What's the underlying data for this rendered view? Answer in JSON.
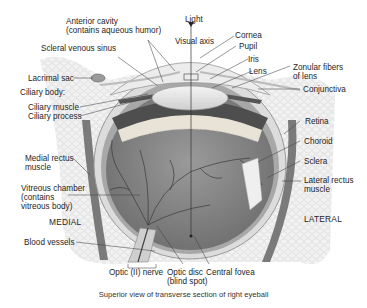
{
  "diagram": {
    "title": "Superior view of transverse section of right eyeball",
    "colors": {
      "background": "#ffffff",
      "tissue_light": "#e6e6e6",
      "tissue_mid": "#bdbdbd",
      "vitreous": "#8c8c8c",
      "ciliary_dark": "#5a5a5a",
      "vessel": "#3a3a3a",
      "label_text": "#262626",
      "leader_line": "#444444"
    },
    "labels": {
      "light": "Light",
      "visual_axis": "Visual axis",
      "anterior_cavity": "Anterior cavity\n(contains aqueous humor)",
      "scleral_venous_sinus": "Scleral venous sinus",
      "lacrimal_sac": "Lacrimal sac",
      "ciliary_body": "Ciliary body:",
      "ciliary_muscle": "Ciliary muscle",
      "ciliary_process": "Ciliary process",
      "cornea": "Cornea",
      "pupil": "Pupil",
      "iris": "Iris",
      "lens": "Lens",
      "zonular_fibers": "Zonular fibers\nof lens",
      "conjunctiva": "Conjunctiva",
      "retina": "Retina",
      "choroid": "Choroid",
      "sclera": "Sclera",
      "lateral_rectus": "Lateral rectus\nmuscle",
      "medial_rectus": "Medial rectus\nmuscle",
      "vitreous_chamber": "Vitreous chamber\n(contains\nvitreous body)",
      "medial": "MEDIAL",
      "lateral": "LATERAL",
      "blood_vessels": "Blood vessels",
      "optic_nerve": "Optic (II) nerve",
      "optic_disc": "Optic disc\n(blind spot)",
      "central_fovea": "Central fovea"
    }
  }
}
